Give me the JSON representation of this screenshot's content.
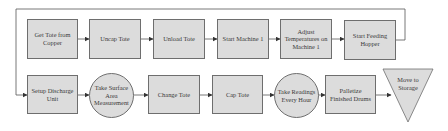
{
  "diagram": {
    "type": "process-flowchart",
    "colors": {
      "fill": "#dcdcdc",
      "stroke": "#6e6e6e",
      "text": "#3a3a3a",
      "line": "#555555"
    },
    "top_row": [
      {
        "id": "n1",
        "label": "Get Tote from Copper",
        "shape": "rectangle"
      },
      {
        "id": "n2",
        "label": "Uncap Tote",
        "shape": "rectangle"
      },
      {
        "id": "n3",
        "label": "Unload Tote",
        "shape": "rectangle"
      },
      {
        "id": "n4",
        "label": "Start Machine 1",
        "shape": "rectangle"
      },
      {
        "id": "n5",
        "label": "Adjust Temperatures on Machine 1",
        "shape": "rectangle"
      },
      {
        "id": "n6",
        "label": "Start Feeding Hopper",
        "shape": "rectangle"
      }
    ],
    "bottom_row": [
      {
        "id": "n7",
        "label": "Setup Discharge Unit",
        "shape": "rectangle"
      },
      {
        "id": "n8",
        "label": "Take Surface Area Measurement",
        "shape": "circle"
      },
      {
        "id": "n9",
        "label": "Change Tote",
        "shape": "rectangle"
      },
      {
        "id": "n10",
        "label": "Cap Tote",
        "shape": "rectangle"
      },
      {
        "id": "n11",
        "label": "Take Readings Every Hour",
        "shape": "circle"
      },
      {
        "id": "n12",
        "label": "Palletize Finished Drums",
        "shape": "rectangle"
      },
      {
        "id": "n13",
        "label": "Move to Storage",
        "shape": "inverted-triangle"
      }
    ],
    "edges": [
      [
        "n1",
        "n2"
      ],
      [
        "n2",
        "n3"
      ],
      [
        "n3",
        "n4"
      ],
      [
        "n4",
        "n5"
      ],
      [
        "n5",
        "n6"
      ],
      [
        "n6",
        "n7"
      ],
      [
        "n7",
        "n8"
      ],
      [
        "n8",
        "n9"
      ],
      [
        "n9",
        "n10"
      ],
      [
        "n10",
        "n11"
      ],
      [
        "n11",
        "n12"
      ],
      [
        "n12",
        "n13"
      ]
    ]
  }
}
